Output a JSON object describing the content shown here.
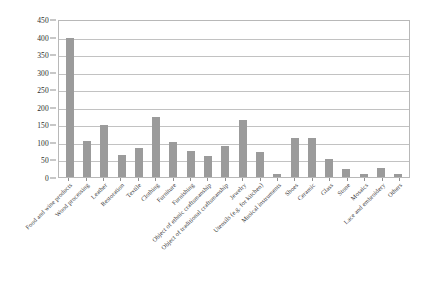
{
  "chart_data": {
    "type": "bar",
    "title": "",
    "xlabel": "",
    "ylabel": "",
    "ylim": [
      0,
      450
    ],
    "ytick_step": 50,
    "grid": true,
    "legend": false,
    "bar_color": "#9b9b9b",
    "categories": [
      "Food and wine products",
      "Wood processing",
      "Leather",
      "Restoration",
      "Textile",
      "Clothing",
      "Furniture",
      "Furnishing",
      "Object of ethnic craftsmanship",
      "Object of traditional craftsmanship",
      "Jewelry",
      "Utensils (e.g. for kitchen)",
      "Musical instruments",
      "Shoes",
      "Ceramic",
      "Glass",
      "Stone",
      "Mosaics",
      "Lace and embroidery",
      "Others"
    ],
    "values": [
      395,
      103,
      148,
      63,
      84,
      172,
      99,
      75,
      61,
      87,
      163,
      72,
      10,
      110,
      112,
      52,
      22,
      8,
      25,
      10
    ],
    "yticks": [
      "0",
      "50",
      "100",
      "150",
      "200",
      "250",
      "300",
      "350",
      "400",
      "450"
    ]
  }
}
